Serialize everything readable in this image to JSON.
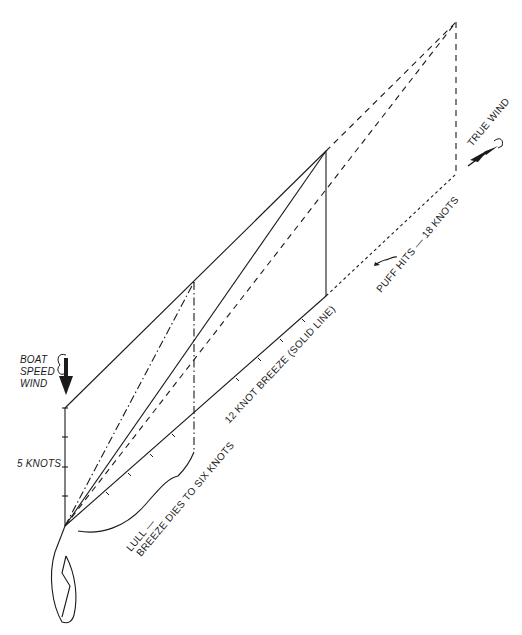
{
  "diagram": {
    "labels": {
      "boat_speed_wind": [
        "BOAT",
        "SPEED",
        "WIND"
      ],
      "five_knots": "5 KNOTS",
      "lull_line1": "LULL —",
      "lull_line2": "BREEZE DIES TO SIX KNOTS",
      "twelve_knot": "12 KNOT BREEZE (SOLID LINE)",
      "puff": "PUFF HITS — 18 KNOTS",
      "true_wind": "TRUE WIND"
    },
    "legend_line_styles": {
      "lull_6_knots": "dash-dot",
      "breeze_12_knots": "solid",
      "puff_18_knots": "dashed"
    },
    "icons": {
      "boat": "boat-hull-icon",
      "boat_speed_wind_arrow": "down-arrow-icon",
      "true_wind_arrow": "diagonal-arrow-icon",
      "puff_symbol": "squiggle-arrow-icon"
    },
    "colors": {
      "ink": "#1a1a1a",
      "background": "#ffffff"
    }
  }
}
